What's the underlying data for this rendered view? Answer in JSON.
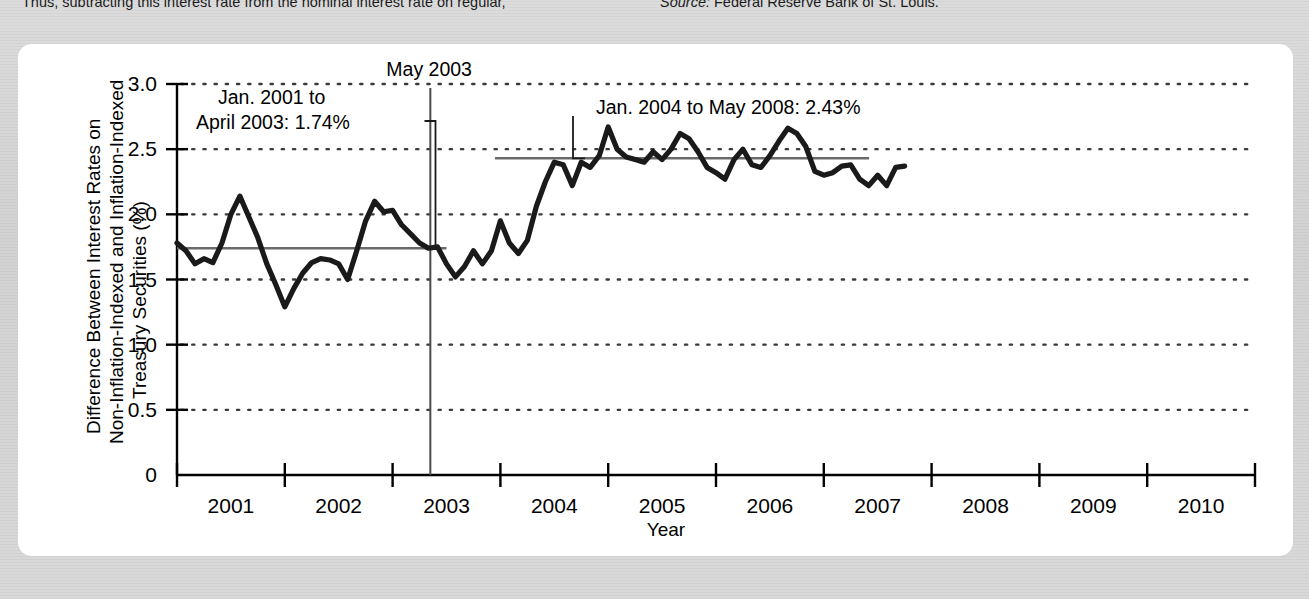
{
  "page": {
    "body_text": "Thus, subtracting this interest rate from the nominal interest rate on regular,",
    "source_prefix": "Source:",
    "source_text": "Federal Reserve Bank of St. Louis."
  },
  "chart_data": {
    "type": "line",
    "title": "",
    "xlabel": "Year",
    "ylabel_lines": [
      "Difference Between Interest Rates on",
      "Non-Inflation-Indexed and Inflation-Indexed",
      "Treasury Securities (%)"
    ],
    "xlim": [
      2001.0,
      2011.0
    ],
    "ylim": [
      0,
      3.0
    ],
    "ytick_labels": [
      "0",
      "0.5",
      "1.0",
      "1.5",
      "2.0",
      "2.5",
      "3.0"
    ],
    "ytick_values": [
      0,
      0.5,
      1.0,
      1.5,
      2.0,
      2.5,
      3.0
    ],
    "xtick_values": [
      2001,
      2002,
      2003,
      2004,
      2005,
      2006,
      2007,
      2008,
      2009,
      2010,
      2011
    ],
    "xtick_labels": [
      "2001",
      "2002",
      "2003",
      "2004",
      "2005",
      "2006",
      "2007",
      "2008",
      "2009",
      "2010"
    ],
    "grid": "horizontal-dotted",
    "legend": "none",
    "series_name": "Difference between non-indexed and indexed Treasury rates",
    "x": [
      2001.0,
      2001.083,
      2001.167,
      2001.25,
      2001.333,
      2001.417,
      2001.5,
      2001.583,
      2001.667,
      2001.75,
      2001.833,
      2001.917,
      2002.0,
      2002.083,
      2002.167,
      2002.25,
      2002.333,
      2002.417,
      2002.5,
      2002.583,
      2002.667,
      2002.75,
      2002.833,
      2002.917,
      2003.0,
      2003.083,
      2003.167,
      2003.25,
      2003.333,
      2003.417,
      2003.5,
      2003.583,
      2003.667,
      2003.75,
      2003.833,
      2003.917,
      2004.0,
      2004.083,
      2004.167,
      2004.25,
      2004.333,
      2004.417,
      2004.5,
      2004.583,
      2004.667,
      2004.75,
      2004.833,
      2004.917,
      2005.0,
      2005.083,
      2005.167,
      2005.25,
      2005.333,
      2005.417,
      2005.5,
      2005.583,
      2005.667,
      2005.75,
      2005.833,
      2005.917,
      2006.0,
      2006.083,
      2006.167,
      2006.25,
      2006.333,
      2006.417,
      2006.5,
      2006.583,
      2006.667,
      2006.75,
      2006.833,
      2006.917,
      2007.0,
      2007.083,
      2007.167,
      2007.25,
      2007.333,
      2007.417,
      2007.5,
      2007.583,
      2007.667,
      2007.75
    ],
    "values": [
      1.78,
      1.72,
      1.62,
      1.66,
      1.63,
      1.78,
      2.0,
      2.14,
      1.98,
      1.82,
      1.62,
      1.46,
      1.29,
      1.43,
      1.55,
      1.63,
      1.66,
      1.65,
      1.62,
      1.5,
      1.72,
      1.95,
      2.1,
      2.02,
      2.03,
      1.92,
      1.85,
      1.78,
      1.74,
      1.75,
      1.62,
      1.52,
      1.6,
      1.72,
      1.62,
      1.72,
      1.95,
      1.78,
      1.7,
      1.8,
      2.06,
      2.25,
      2.4,
      2.38,
      2.22,
      2.4,
      2.36,
      2.45,
      2.67,
      2.5,
      2.44,
      2.42,
      2.4,
      2.48,
      2.42,
      2.5,
      2.62,
      2.58,
      2.48,
      2.36,
      2.32,
      2.27,
      2.42,
      2.5,
      2.38,
      2.36,
      2.45,
      2.56,
      2.66,
      2.62,
      2.52,
      2.33,
      2.3,
      2.32,
      2.37,
      2.38,
      2.27,
      2.22,
      2.3,
      2.22,
      2.36,
      2.37
    ]
  },
  "reference_lines": [
    {
      "name": "avg-2001-2003",
      "label": "Jan. 2001 to\nApril 2003: 1.74%",
      "label_line1": "Jan. 2001 to",
      "label_line2": "April 2003: 1.74%",
      "value": 1.74,
      "x_start": 2001.0,
      "x_end": 2003.5,
      "color": "#6a6a6a"
    },
    {
      "name": "avg-2004-2008",
      "label": "Jan. 2004 to May 2008: 2.43%",
      "value": 2.43,
      "x_start": 2003.95,
      "x_end": 2007.42,
      "color": "#6a6a6a"
    }
  ],
  "event_marker": {
    "name": "may-2003",
    "label": "May 2003",
    "x": 2003.35,
    "color": "#4a4a4a"
  },
  "colors": {
    "page_background": "#d8d8d8",
    "panel_background": "#ffffff",
    "series_line": "#1a1a1a",
    "axis": "#000000",
    "grid_dots": "#3a3a3a",
    "reference_line": "#6a6a6a",
    "text": "#1b1b1b"
  }
}
